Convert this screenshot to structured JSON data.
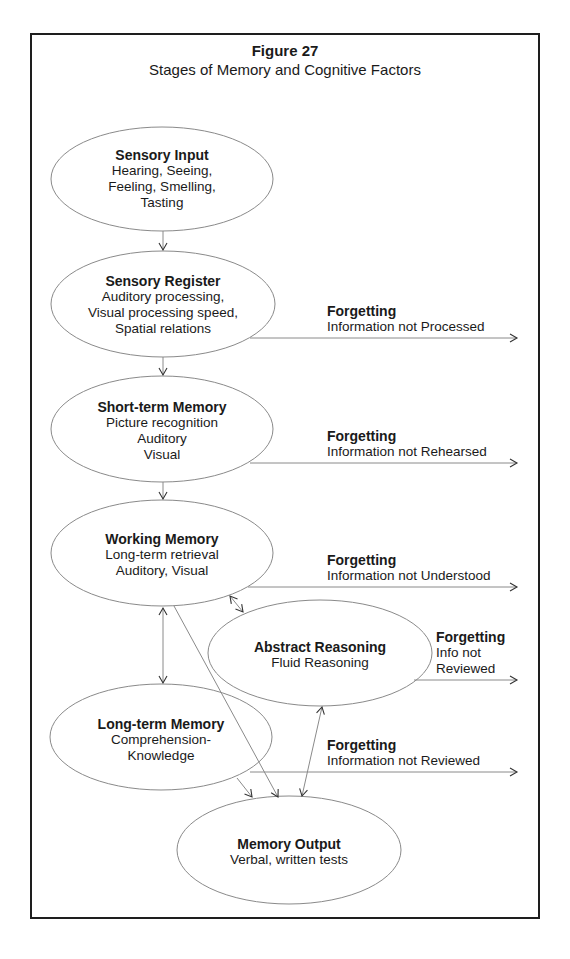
{
  "figure": {
    "number_label": "Figure 27",
    "title": "Stages of Memory and Cognitive Factors"
  },
  "nodes": {
    "sensory_input": {
      "title": "Sensory Input",
      "lines": [
        "Hearing, Seeing,",
        "Feeling, Smelling,",
        "Tasting"
      ]
    },
    "sensory_register": {
      "title": "Sensory Register",
      "lines": [
        "Auditory processing,",
        "Visual processing speed,",
        "Spatial relations"
      ]
    },
    "short_term_memory": {
      "title": "Short-term Memory",
      "lines": [
        "Picture recognition",
        "Auditory",
        "Visual"
      ]
    },
    "working_memory": {
      "title": "Working Memory",
      "lines": [
        "Long-term retrieval",
        "Auditory, Visual"
      ]
    },
    "abstract_reasoning": {
      "title": "Abstract Reasoning",
      "lines": [
        "Fluid Reasoning"
      ]
    },
    "long_term_memory": {
      "title": "Long-term Memory",
      "lines": [
        "Comprehension-",
        "Knowledge"
      ]
    },
    "memory_output": {
      "title": "Memory Output",
      "lines": [
        "Verbal, written tests"
      ]
    }
  },
  "forgetting": [
    {
      "title": "Forgetting",
      "lines": [
        "Information not Processed"
      ]
    },
    {
      "title": "Forgetting",
      "lines": [
        "Information not Rehearsed"
      ]
    },
    {
      "title": "Forgetting",
      "lines": [
        "Information not Understood"
      ]
    },
    {
      "title": "Forgetting",
      "lines": [
        "Info not",
        "Reviewed"
      ]
    },
    {
      "title": "Forgetting",
      "lines": [
        "Information not Reviewed"
      ]
    }
  ],
  "colors": {
    "line": "#8a8a8a",
    "frame": "#1e1e1e",
    "text": "#1a1a1a"
  }
}
